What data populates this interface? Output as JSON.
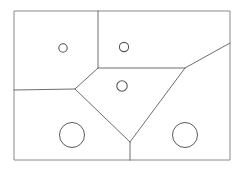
{
  "figure": {
    "canvas": {
      "width": 241,
      "height": 172
    },
    "background_color": "#ffffff",
    "line_color": "#6e6e6e",
    "frame_color": "#8a8a8a",
    "hole_color": "#555555"
  },
  "chart_data": {
    "type": "diagram",
    "xlabel": "",
    "ylabel": "",
    "xlim": [
      0,
      241
    ],
    "ylim": [
      0,
      172
    ],
    "grid": false,
    "legend": "none",
    "outer_boundary": {
      "name": "outer-rectangle",
      "points": [
        [
          14,
          11
        ],
        [
          230,
          11
        ],
        [
          230,
          160
        ],
        [
          14,
          160
        ]
      ]
    },
    "internal_edges": [
      {
        "name": "top-vertical-divider",
        "points": [
          [
            98,
            11
          ],
          [
            98,
            68
          ]
        ]
      },
      {
        "name": "middle-horizontal-divider",
        "points": [
          [
            98,
            68
          ],
          [
            185,
            68
          ]
        ]
      },
      {
        "name": "left-horizontal-divider",
        "points": [
          [
            14,
            90
          ],
          [
            75,
            89
          ],
          [
            98,
            68
          ]
        ]
      },
      {
        "name": "upper-right-diagonal",
        "points": [
          [
            185,
            68
          ],
          [
            230,
            43
          ]
        ]
      },
      {
        "name": "left-descending-diagonal",
        "points": [
          [
            75,
            89
          ],
          [
            130,
            142
          ]
        ]
      },
      {
        "name": "right-descending-diagonal",
        "points": [
          [
            185,
            68
          ],
          [
            130,
            142
          ]
        ]
      },
      {
        "name": "bottom-vertical-divider",
        "points": [
          [
            130,
            142
          ],
          [
            130,
            160
          ]
        ]
      }
    ],
    "circles": [
      {
        "name": "small-circle-upper-left",
        "cx": 63,
        "cy": 48,
        "r": 4.2,
        "size": "small"
      },
      {
        "name": "small-circle-upper-right",
        "cx": 124,
        "cy": 47,
        "r": 4.6,
        "size": "small"
      },
      {
        "name": "small-circle-center",
        "cx": 122,
        "cy": 86,
        "r": 5.2,
        "size": "small"
      },
      {
        "name": "large-circle-bottom-left",
        "cx": 72,
        "cy": 135,
        "r": 12.5,
        "size": "large"
      },
      {
        "name": "large-circle-bottom-right",
        "cx": 185,
        "cy": 135,
        "r": 12.5,
        "size": "large"
      }
    ],
    "region_count": 6,
    "circle_count": 5
  }
}
